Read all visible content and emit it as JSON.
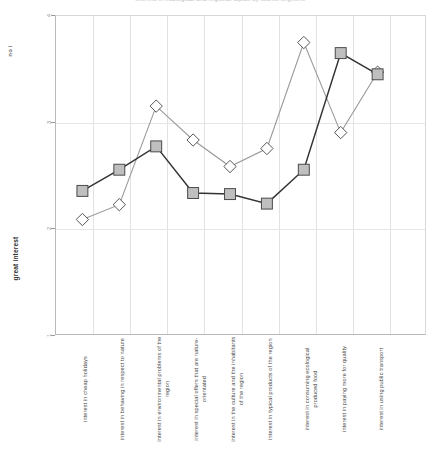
{
  "chart_data": {
    "type": "line",
    "title": "Interest in ecological and regional topics by tourist segment",
    "xlabel": "",
    "ylabel": "",
    "ylim": [
      1,
      4
    ],
    "yticks": [
      1,
      2,
      3,
      4
    ],
    "y_axis_top_label": "no interest",
    "y_axis_bottom_label": "great interest",
    "grid": true,
    "legend_position": "none",
    "categories": [
      "interest in cheap holidays",
      "interest in behaving in respect to nature",
      "interest in environmental problems of the region",
      "interest in special offers that are nature-orientated",
      "interest in the culture and the inhabitants of the region",
      "interest in typical products of the region",
      "interest in consuming ecological produced food",
      "interest in paying more for quality",
      "interest in using public transport"
    ],
    "series": [
      {
        "name": "Series 1",
        "marker": "square",
        "color": "#333333",
        "marker_fill": "#bfbfbf",
        "values": [
          2.35,
          2.55,
          2.77,
          2.33,
          2.32,
          2.23,
          2.55,
          3.65,
          3.45
        ]
      },
      {
        "name": "Series 2",
        "marker": "diamond",
        "color": "#999999",
        "marker_fill": "#ffffff",
        "values": [
          2.08,
          2.22,
          3.15,
          2.83,
          2.58,
          2.75,
          3.75,
          2.9,
          3.47
        ]
      }
    ]
  },
  "axis": {
    "tick_labels": [
      "4",
      "3",
      "2",
      "1"
    ],
    "top_label": "no i",
    "bottom_label": "great interest"
  }
}
